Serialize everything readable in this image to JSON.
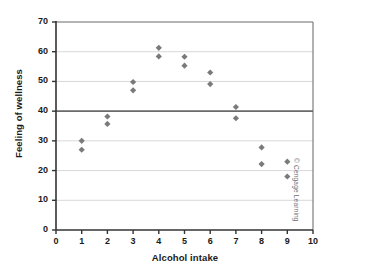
{
  "chart_data": {
    "type": "scatter",
    "title": "",
    "xlabel": "Alcohol intake",
    "ylabel": "Feeling of wellness",
    "xlim": [
      0,
      10
    ],
    "ylim": [
      0,
      70
    ],
    "xticks": [
      0,
      1,
      2,
      3,
      4,
      5,
      6,
      7,
      8,
      9,
      10
    ],
    "yticks": [
      0,
      10,
      20,
      30,
      40,
      50,
      60,
      70
    ],
    "grid": "horizontal",
    "legend": "none",
    "marker": "diamond",
    "marker_color": "#7a7a7a",
    "reference_line": {
      "y": 40,
      "color": "#6b6b6b",
      "label": ""
    },
    "points": [
      {
        "x": 1,
        "y": 30.0
      },
      {
        "x": 1,
        "y": 27.0
      },
      {
        "x": 2,
        "y": 38.2
      },
      {
        "x": 2,
        "y": 35.7
      },
      {
        "x": 3,
        "y": 49.8
      },
      {
        "x": 3,
        "y": 47.0
      },
      {
        "x": 4,
        "y": 61.3
      },
      {
        "x": 4,
        "y": 58.4
      },
      {
        "x": 5,
        "y": 58.3
      },
      {
        "x": 5,
        "y": 55.3
      },
      {
        "x": 6,
        "y": 53.0
      },
      {
        "x": 6,
        "y": 49.1
      },
      {
        "x": 7,
        "y": 41.4
      },
      {
        "x": 7,
        "y": 37.6
      },
      {
        "x": 8,
        "y": 27.8
      },
      {
        "x": 8,
        "y": 22.2
      },
      {
        "x": 9,
        "y": 23.0
      },
      {
        "x": 9,
        "y": 18.0
      }
    ]
  },
  "credit": "© Cengage Learning"
}
